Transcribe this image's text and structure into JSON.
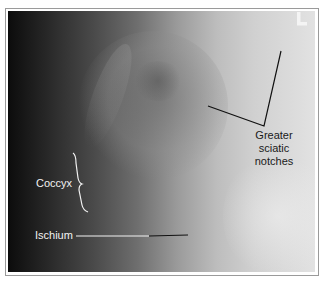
{
  "figure": {
    "corner_marker": "L",
    "labels": {
      "greater_sciatic_notches": [
        "Greater",
        "sciatic",
        "notches"
      ],
      "coccyx": "Coccyx",
      "ischium": "Ischium"
    },
    "colors": {
      "frame_border": "#9a9a9a",
      "dark_label_line": "#111111",
      "light_label_line": "#f2f2f2"
    }
  }
}
